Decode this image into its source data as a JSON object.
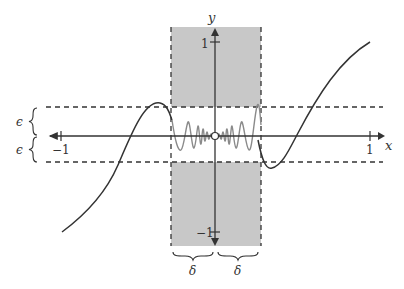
{
  "diagram": {
    "axes": {
      "x_label": "x",
      "y_label": "y",
      "x_ticks": [
        {
          "value": -1,
          "label": "−1"
        },
        {
          "value": 1,
          "label": "1"
        }
      ],
      "y_ticks": [
        {
          "value": 1,
          "label": "1"
        },
        {
          "value": -1,
          "label": "−1"
        }
      ]
    },
    "bands": {
      "epsilon_label": "ϵ",
      "delta_label": "δ"
    },
    "colors": {
      "shade": "#c8c8c8",
      "curve": "#333333",
      "oscillation": "#8a8a8a",
      "axis": "#333333"
    }
  }
}
